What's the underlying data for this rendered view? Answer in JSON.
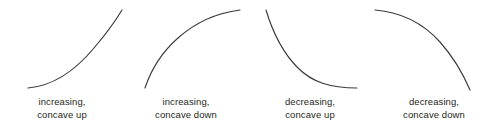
{
  "figure": {
    "width": 496,
    "height": 134,
    "background_color": "#ffffff",
    "curve_color": "#3a3a3c",
    "text_color": "#1f1f21",
    "panels": [
      {
        "id": "increasing-concave-up",
        "caption_line1": "increasing,",
        "caption_line2": "concave up",
        "direction": "increasing",
        "concavity": "up",
        "path": "M 28 88 C 52 86 74 72 94 48 C 106 34 116 20 122 10"
      },
      {
        "id": "increasing-concave-down",
        "caption_line1": "increasing,",
        "caption_line2": "concave down",
        "direction": "increasing",
        "concavity": "down",
        "path": "M 21 88 C 27 70 38 52 54 38 C 72 22 92 13 116 10"
      },
      {
        "id": "decreasing-concave-up",
        "caption_line1": "decreasing,",
        "caption_line2": "concave up",
        "direction": "decreasing",
        "concavity": "up",
        "path": "M 18 10 C 24 30 34 52 50 68 C 64 82 82 88 109 88"
      },
      {
        "id": "decreasing-concave-down",
        "caption_line1": "decreasing,",
        "caption_line2": "concave down",
        "direction": "decreasing",
        "concavity": "down",
        "path": "M 3 10 C 28 12 50 22 68 42 C 84 60 92 76 98 90"
      }
    ]
  }
}
